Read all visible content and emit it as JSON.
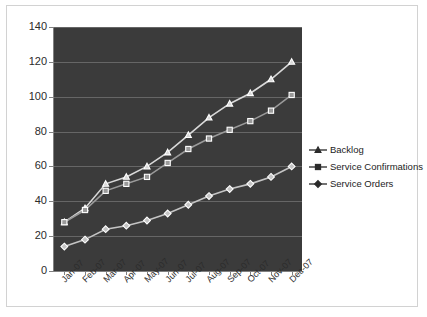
{
  "chart_data": {
    "type": "line",
    "title": "",
    "xlabel": "",
    "ylabel": "",
    "ylim": [
      0,
      140
    ],
    "ytick_step": 20,
    "yticks": [
      "140",
      "120",
      "100",
      "80",
      "60",
      "40",
      "20",
      "0"
    ],
    "categories": [
      "Jan-07",
      "Feb-07",
      "Mar-07",
      "Apr-07",
      "May-07",
      "Jun-07",
      "Jul-07",
      "Aug-07",
      "Sep-07",
      "Oct-07",
      "Nov-07",
      "Dec-07"
    ],
    "grid": true,
    "legend_position": "right",
    "plot_background": "#3b3b3b",
    "gridline_color": "#6e6e6e",
    "series": [
      {
        "name": "Backlog",
        "marker": "triangle",
        "color": "#d9d9d9",
        "values": [
          28,
          36,
          50,
          54,
          60,
          68,
          78,
          88,
          96,
          102,
          110,
          120
        ]
      },
      {
        "name": "Service Confirmations",
        "marker": "square",
        "color": "#9a9a9a",
        "values": [
          28,
          35,
          46,
          50,
          54,
          62,
          70,
          76,
          81,
          86,
          92,
          101
        ]
      },
      {
        "name": "Service Orders",
        "marker": "diamond",
        "color": "#c4c4c4",
        "values": [
          14,
          18,
          24,
          26,
          29,
          33,
          38,
          43,
          47,
          50,
          54,
          60
        ]
      }
    ]
  },
  "legend": {
    "items": [
      {
        "label": "Backlog",
        "marker": "triangle-marker"
      },
      {
        "label": "Service Confirmations",
        "marker": "square-marker"
      },
      {
        "label": "Service Orders",
        "marker": "diamond-marker"
      }
    ]
  }
}
